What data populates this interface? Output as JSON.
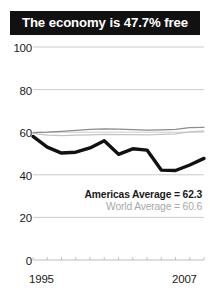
{
  "title": {
    "text": "The economy is 47.7% free"
  },
  "legend": {
    "americas": "Americas Average = 62.3",
    "world": "World Average = 60.6"
  },
  "colors": {
    "title_background": "#111111",
    "title_text": "#ffffff",
    "country_line": "#111111",
    "americas_line": "#8c8c8c",
    "world_line": "#c4c4c4",
    "gridline": "#b5b5b5",
    "axis_text": "#1a1a1a",
    "world_label_text": "#a8a8a8"
  },
  "chart_data": {
    "type": "line",
    "title": "The economy is 47.7% free",
    "xlabel": "",
    "ylabel": "",
    "xlim": [
      1995,
      2007
    ],
    "ylim": [
      0,
      100
    ],
    "yticks": [
      0,
      20,
      40,
      60,
      80,
      100
    ],
    "xticks": [
      1995,
      1996,
      1997,
      1998,
      1999,
      2000,
      2001,
      2002,
      2003,
      2004,
      2005,
      2006,
      2007
    ],
    "xtick_labels_shown": [
      "1995",
      "2007"
    ],
    "grid": true,
    "legend_position": "inside-right",
    "x": [
      1995,
      1996,
      1997,
      1998,
      1999,
      2000,
      2001,
      2002,
      2003,
      2004,
      2005,
      2006,
      2007
    ],
    "series": [
      {
        "name": "Country economic freedom",
        "color": "#111111",
        "width": "thick",
        "values": [
          58.0,
          53.0,
          50.2,
          50.6,
          52.6,
          56.0,
          49.6,
          52.2,
          51.6,
          42.2,
          42.0,
          44.6,
          47.7
        ]
      },
      {
        "name": "Americas Average",
        "color": "#8c8c8c",
        "width": "thin",
        "average": 62.3,
        "values": [
          59.8,
          60.0,
          60.4,
          60.9,
          61.3,
          61.6,
          61.4,
          61.2,
          61.0,
          61.1,
          61.3,
          62.1,
          62.3
        ]
      },
      {
        "name": "World Average",
        "color": "#c4c4c4",
        "width": "thin",
        "average": 60.6,
        "values": [
          59.4,
          58.6,
          58.4,
          58.6,
          58.8,
          59.0,
          58.9,
          58.9,
          58.8,
          59.0,
          59.2,
          60.2,
          60.6
        ]
      }
    ]
  },
  "axis": {
    "y_labels": [
      "100",
      "80",
      "60",
      "40",
      "20",
      "0"
    ],
    "x_label_left": "1995",
    "x_label_right": "2007"
  }
}
